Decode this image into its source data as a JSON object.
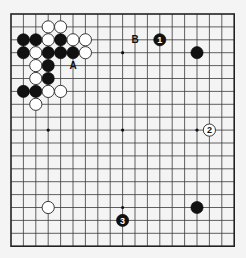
{
  "board": {
    "size": 19,
    "origin": {
      "x": 11,
      "y": 14
    },
    "spacing": {
      "x": 12.4,
      "y": 12.9
    },
    "stone_radius": 6.1,
    "background": "#f4f4f4",
    "line_color": "#3a3a3a"
  },
  "star_points": [
    [
      3,
      3
    ],
    [
      9,
      3
    ],
    [
      15,
      3
    ],
    [
      3,
      9
    ],
    [
      9,
      9
    ],
    [
      15,
      9
    ],
    [
      3,
      15
    ],
    [
      9,
      15
    ],
    [
      15,
      15
    ]
  ],
  "stones": [
    {
      "color": "white",
      "col": 3,
      "row": 1
    },
    {
      "color": "white",
      "col": 4,
      "row": 1
    },
    {
      "color": "black",
      "col": 1,
      "row": 2
    },
    {
      "color": "black",
      "col": 2,
      "row": 2
    },
    {
      "color": "white",
      "col": 3,
      "row": 2
    },
    {
      "color": "black",
      "col": 4,
      "row": 2
    },
    {
      "color": "white",
      "col": 5,
      "row": 2
    },
    {
      "color": "white",
      "col": 6,
      "row": 2
    },
    {
      "color": "black",
      "col": 1,
      "row": 3
    },
    {
      "color": "white",
      "col": 2,
      "row": 3
    },
    {
      "color": "black",
      "col": 3,
      "row": 3
    },
    {
      "color": "black",
      "col": 4,
      "row": 3
    },
    {
      "color": "black",
      "col": 5,
      "row": 3
    },
    {
      "color": "white",
      "col": 6,
      "row": 3
    },
    {
      "color": "white",
      "col": 2,
      "row": 4
    },
    {
      "color": "black",
      "col": 3,
      "row": 4
    },
    {
      "color": "white",
      "col": 2,
      "row": 5
    },
    {
      "color": "black",
      "col": 3,
      "row": 5
    },
    {
      "color": "black",
      "col": 1,
      "row": 6
    },
    {
      "color": "black",
      "col": 2,
      "row": 6
    },
    {
      "color": "white",
      "col": 3,
      "row": 6
    },
    {
      "color": "white",
      "col": 4,
      "row": 6
    },
    {
      "color": "white",
      "col": 2,
      "row": 7
    },
    {
      "color": "black",
      "col": 15,
      "row": 3
    },
    {
      "color": "black",
      "col": 12,
      "row": 2,
      "number": "1"
    },
    {
      "color": "white",
      "col": 16,
      "row": 9,
      "number": "2"
    },
    {
      "color": "white",
      "col": 3,
      "row": 15
    },
    {
      "color": "black",
      "col": 9,
      "row": 16,
      "number": "3"
    },
    {
      "color": "black",
      "col": 15,
      "row": 15
    }
  ],
  "labels": [
    {
      "text": "A",
      "col": 5,
      "row": 4
    },
    {
      "text": "B",
      "col": 10,
      "row": 2
    }
  ]
}
